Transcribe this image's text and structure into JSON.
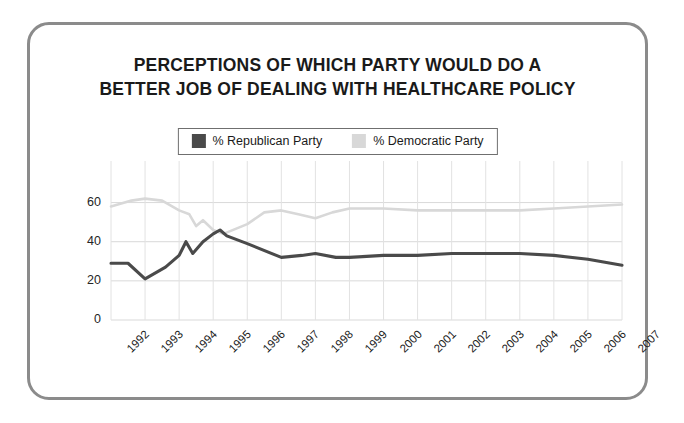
{
  "title": {
    "line1": "PERCEPTIONS OF WHICH PARTY WOULD DO A",
    "line2": "BETTER JOB OF DEALING WITH HEALTHCARE POLICY"
  },
  "legend": {
    "republican_label": "% Republican Party",
    "democratic_label": "% Democratic Party",
    "republican_color": "#4a4a4a",
    "democratic_color": "#d8d8d8"
  },
  "frame": {
    "border_color": "#8b8b8b",
    "background": "#ffffff"
  },
  "axis": {
    "y_ticks": [
      "0",
      "20",
      "40",
      "60"
    ],
    "x_ticks": [
      "1992",
      "1993",
      "1994",
      "1995",
      "1996",
      "1997",
      "1998",
      "1999",
      "2000",
      "2001",
      "2002",
      "2003",
      "2004",
      "2005",
      "2006",
      "2007"
    ]
  },
  "chart_data": {
    "type": "line",
    "title": "PERCEPTIONS OF WHICH PARTY WOULD DO A BETTER JOB OF DEALING WITH HEALTHCARE POLICY",
    "xlabel": "",
    "ylabel": "",
    "ylim": [
      0,
      70
    ],
    "yticks": [
      0,
      20,
      40,
      60
    ],
    "grid": true,
    "legend_position": "top-center",
    "x": [
      "1992",
      "1993",
      "1994",
      "1995",
      "1996",
      "1997",
      "1998",
      "1999",
      "2000",
      "2001",
      "2002",
      "2003",
      "2004",
      "2005",
      "2006",
      "2007"
    ],
    "series": [
      {
        "name": "% Republican Party",
        "color": "#4a4a4a",
        "points": [
          {
            "x": 1992.0,
            "y": 29
          },
          {
            "x": 1992.5,
            "y": 29
          },
          {
            "x": 1993.0,
            "y": 21
          },
          {
            "x": 1993.6,
            "y": 27
          },
          {
            "x": 1994.0,
            "y": 33
          },
          {
            "x": 1994.2,
            "y": 40
          },
          {
            "x": 1994.4,
            "y": 34
          },
          {
            "x": 1994.7,
            "y": 40
          },
          {
            "x": 1995.0,
            "y": 44
          },
          {
            "x": 1995.2,
            "y": 46
          },
          {
            "x": 1995.4,
            "y": 43
          },
          {
            "x": 1996.0,
            "y": 39
          },
          {
            "x": 1997.0,
            "y": 32
          },
          {
            "x": 1997.6,
            "y": 33
          },
          {
            "x": 1998.0,
            "y": 34
          },
          {
            "x": 1998.6,
            "y": 32
          },
          {
            "x": 1999.0,
            "y": 32
          },
          {
            "x": 2000.0,
            "y": 33
          },
          {
            "x": 2001.0,
            "y": 33
          },
          {
            "x": 2002.0,
            "y": 34
          },
          {
            "x": 2003.0,
            "y": 34
          },
          {
            "x": 2004.0,
            "y": 34
          },
          {
            "x": 2005.0,
            "y": 33
          },
          {
            "x": 2006.0,
            "y": 31
          },
          {
            "x": 2007.0,
            "y": 28
          }
        ]
      },
      {
        "name": "% Democratic Party",
        "color": "#d8d8d8",
        "points": [
          {
            "x": 1992.0,
            "y": 58
          },
          {
            "x": 1992.6,
            "y": 61
          },
          {
            "x": 1993.0,
            "y": 62
          },
          {
            "x": 1993.5,
            "y": 61
          },
          {
            "x": 1994.0,
            "y": 56
          },
          {
            "x": 1994.3,
            "y": 54
          },
          {
            "x": 1994.5,
            "y": 48
          },
          {
            "x": 1994.7,
            "y": 51
          },
          {
            "x": 1995.0,
            "y": 46
          },
          {
            "x": 1995.3,
            "y": 44
          },
          {
            "x": 1996.0,
            "y": 49
          },
          {
            "x": 1996.5,
            "y": 55
          },
          {
            "x": 1997.0,
            "y": 56
          },
          {
            "x": 1997.5,
            "y": 54
          },
          {
            "x": 1998.0,
            "y": 52
          },
          {
            "x": 1998.5,
            "y": 55
          },
          {
            "x": 1999.0,
            "y": 57
          },
          {
            "x": 2000.0,
            "y": 57
          },
          {
            "x": 2001.0,
            "y": 56
          },
          {
            "x": 2002.0,
            "y": 56
          },
          {
            "x": 2003.0,
            "y": 56
          },
          {
            "x": 2004.0,
            "y": 56
          },
          {
            "x": 2005.0,
            "y": 57
          },
          {
            "x": 2006.0,
            "y": 58
          },
          {
            "x": 2007.0,
            "y": 59
          }
        ]
      }
    ]
  }
}
